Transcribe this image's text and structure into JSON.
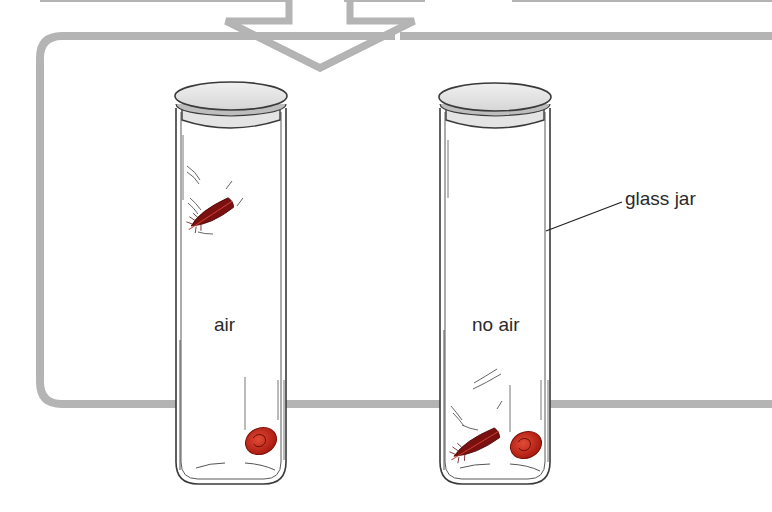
{
  "diagram": {
    "title": "",
    "colors": {
      "frame": "#b4b4b4",
      "jar_outline": "#3a3a3a",
      "lid_fill": "#e6e6e6",
      "feather": "#8b1414",
      "coin": "#c8281e",
      "text": "#2a2a2a"
    },
    "jars": [
      {
        "id": "jar-air",
        "label": "air",
        "contents": [
          "feather (falling slowly, near top)",
          "coin (at bottom)"
        ]
      },
      {
        "id": "jar-no-air",
        "label": "no air",
        "contents": [
          "feather (at bottom)",
          "coin (at bottom)"
        ]
      }
    ],
    "callouts": [
      {
        "text": "glass jar",
        "points_to": "jar-no-air wall"
      }
    ],
    "flow_arrow": {
      "direction": "down",
      "meaning": "leads into comparison panel"
    }
  }
}
